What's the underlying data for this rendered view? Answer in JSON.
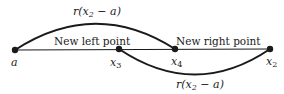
{
  "diagram": {
    "type": "golden-section-search",
    "points": [
      {
        "id": "a",
        "label": "a",
        "x": 15,
        "y": 50
      },
      {
        "id": "x3",
        "label": "x",
        "sub": "3",
        "x": 119,
        "y": 49
      },
      {
        "id": "x4",
        "label": "x",
        "sub": "4",
        "x": 175,
        "y": 49
      },
      {
        "id": "x2",
        "label": "x",
        "sub": "2",
        "x": 270,
        "y": 49
      }
    ],
    "annotations": {
      "new_left_point": "New left point",
      "new_right_point": "New right point"
    },
    "arcs": {
      "top": {
        "from": "a",
        "to": "x4",
        "label_r": "r(x",
        "label_sub": "2",
        "label_rest": " − a)"
      },
      "bottom": {
        "from": "x3",
        "to": "x2",
        "label_r": "r(x",
        "label_sub": "2",
        "label_rest": " − a)"
      }
    },
    "colors": {
      "ink": "#1a1a1a",
      "background": "#ffffff"
    }
  }
}
